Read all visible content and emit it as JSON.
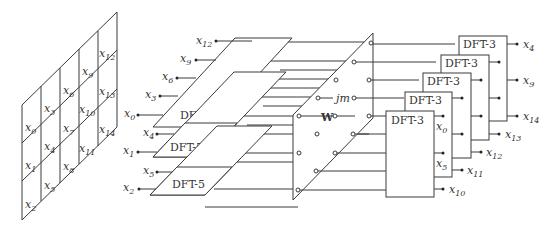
{
  "diagram": {
    "title": "",
    "input_grid": {
      "columns": [
        [
          "x0",
          "x1",
          "x2"
        ],
        [
          "x3",
          "x4",
          "x5"
        ],
        [
          "x6",
          "x7",
          "x8"
        ],
        [
          "x9",
          "x10",
          "x11"
        ],
        [
          "x12",
          "x13",
          "x14"
        ]
      ]
    },
    "dft5_blocks": [
      {
        "label": "DFT-5",
        "inputs": [
          "x0",
          "x3",
          "x6",
          "x9",
          "x12"
        ]
      },
      {
        "label": "DFT-5",
        "inputs": [
          "x1",
          "x4",
          "x7",
          "x10",
          "x13"
        ]
      },
      {
        "label": "DFT-5",
        "inputs": [
          "x2",
          "x5",
          "x8",
          "x11",
          "x14"
        ]
      }
    ],
    "twiddle": {
      "symbol": "W",
      "exponent": "jm"
    },
    "dft3_blocks": [
      {
        "label": "DFT-3",
        "outputs": [
          "x0",
          "x5",
          "x10"
        ]
      },
      {
        "label": "DFT-3",
        "outputs": [
          "x3",
          "x8",
          "x13"
        ]
      },
      {
        "label": "DFT-3",
        "outputs": [
          "x6",
          "x11",
          "x1"
        ]
      },
      {
        "label": "DFT-3",
        "outputs": [
          "x9",
          "x14",
          "x4"
        ]
      },
      {
        "label": "DFT-3",
        "outputs": [
          "x12",
          "x2",
          "x7"
        ]
      }
    ],
    "visible_output_labels": [
      "x4",
      "x9",
      "x14",
      "x13",
      "x12",
      "x11",
      "x10",
      "x0",
      "x5"
    ],
    "input_labels_left": [
      "x12",
      "x9",
      "x6",
      "x3",
      "x0",
      "x4",
      "x1",
      "x5",
      "x2"
    ]
  }
}
